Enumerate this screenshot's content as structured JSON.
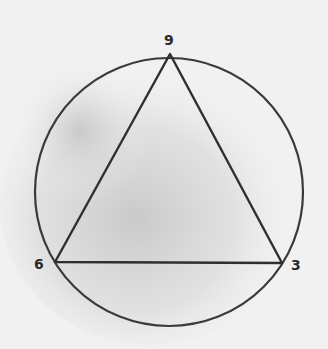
{
  "diagram": {
    "circle": {
      "cx": 169,
      "cy": 192,
      "r": 134
    },
    "triangle": {
      "vertices": [
        {
          "label": "9",
          "x": 170,
          "y": 54
        },
        {
          "label": "6",
          "x": 55,
          "y": 262
        },
        {
          "label": "3",
          "x": 282,
          "y": 263
        }
      ]
    },
    "labels": {
      "top": "9",
      "left": "6",
      "right": "3"
    },
    "colors": {
      "stroke": "#3a3a3a",
      "background": "#f1f1f1",
      "shadow": "#c9c9c9"
    }
  }
}
